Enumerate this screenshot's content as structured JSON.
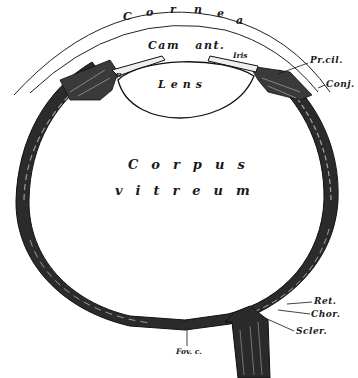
{
  "figure": {
    "colors": {
      "ink": "#111111",
      "paper": "#ffffff",
      "wall_fill": "#3a3a3a",
      "wall_light": "#8a8a8a"
    }
  },
  "labels": {
    "cornea": "Cornea",
    "cornea_letters": [
      "C",
      "o",
      "r",
      "n",
      "e",
      "a"
    ],
    "cam_ant": "Cam ant.",
    "iris": "Iris",
    "lens": "Lens",
    "p": "p",
    "pr_cil": "Pr.cil.",
    "conj": "Conj.",
    "corpus": "Corpus",
    "vitreum": "vitreum",
    "ret": "Ret.",
    "chor": "Chor.",
    "scler": "Scler.",
    "fov_c": "Fov. c."
  }
}
